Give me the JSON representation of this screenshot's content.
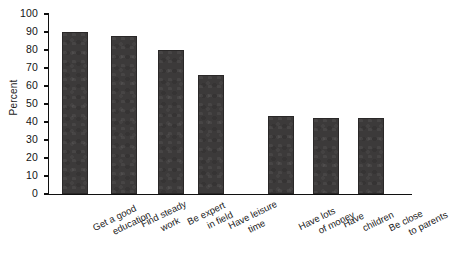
{
  "chart_data": {
    "type": "bar",
    "title": "",
    "xlabel": "",
    "ylabel": "Percent",
    "ylim": [
      0,
      100
    ],
    "ytick_step": 10,
    "grid": false,
    "legend": false,
    "bar_color": "#3c3a3a",
    "categories": [
      "Get a good education",
      "Find steady work",
      "Be expert in field",
      "Have leisure time",
      "Have lots of money",
      "Have children",
      "Be close to parents"
    ],
    "category_lines": [
      [
        "Get a good",
        "education"
      ],
      [
        "Find steady",
        "work"
      ],
      [
        "Be expert",
        "in field"
      ],
      [
        "Have leisure",
        "time"
      ],
      [
        "Have lots",
        "of money"
      ],
      [
        "Have",
        "children"
      ],
      [
        "Be close",
        "to parents"
      ]
    ],
    "values": [
      90,
      88,
      80,
      66,
      43.5,
      42.5,
      42
    ],
    "yticks": [
      0,
      10,
      20,
      30,
      40,
      50,
      60,
      70,
      80,
      90,
      100
    ],
    "ytick_labels": [
      "0",
      "10",
      "20",
      "30",
      "40",
      "50",
      "60",
      "70",
      "80",
      "90",
      "100"
    ]
  }
}
